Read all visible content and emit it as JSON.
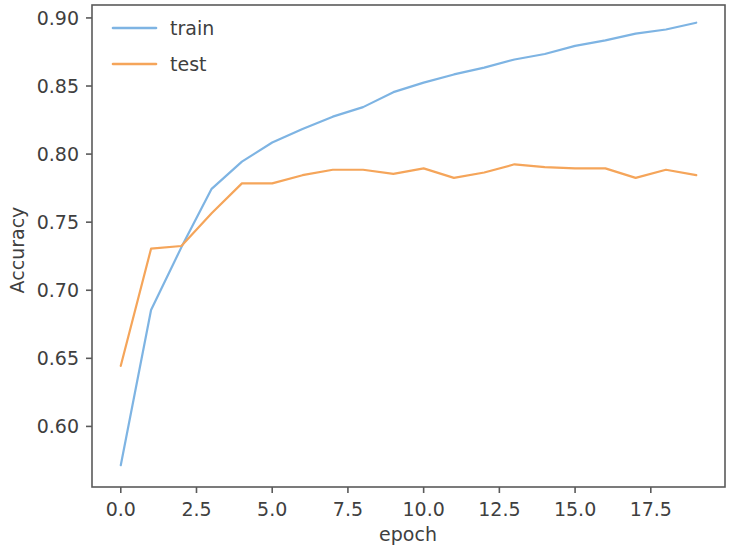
{
  "chart_data": {
    "type": "line",
    "title": "",
    "xlabel": "epoch",
    "ylabel": "Accuracy",
    "xlim": [
      -0.95,
      19.95
    ],
    "ylim": [
      0.5555,
      0.9095
    ],
    "grid": false,
    "legend_position": "upper left",
    "legend_frame": false,
    "xticks": [
      0.0,
      2.5,
      5.0,
      7.5,
      10.0,
      12.5,
      15.0,
      17.5
    ],
    "xtick_labels": [
      "0.0",
      "2.5",
      "5.0",
      "7.5",
      "10.0",
      "12.5",
      "15.0",
      "17.5"
    ],
    "yticks": [
      0.6,
      0.65,
      0.7,
      0.75,
      0.8,
      0.85,
      0.9
    ],
    "ytick_labels": [
      "0.60",
      "0.65",
      "0.70",
      "0.75",
      "0.80",
      "0.85",
      "0.90"
    ],
    "x": [
      0,
      1,
      2,
      3,
      4,
      5,
      6,
      7,
      8,
      9,
      10,
      11,
      12,
      13,
      14,
      15,
      16,
      17,
      18,
      19
    ],
    "series": [
      {
        "name": "train",
        "color": "#7EB4E3",
        "values": [
          0.5715,
          0.6855,
          0.7315,
          0.7745,
          0.7945,
          0.8085,
          0.8185,
          0.8275,
          0.8345,
          0.8455,
          0.8525,
          0.8585,
          0.8635,
          0.8695,
          0.8735,
          0.8795,
          0.8835,
          0.8885,
          0.8915,
          0.8965
        ]
      },
      {
        "name": "test",
        "color": "#F5A55A",
        "values": [
          0.6445,
          0.7305,
          0.7325,
          0.7565,
          0.7785,
          0.7785,
          0.7845,
          0.7885,
          0.7885,
          0.7855,
          0.7895,
          0.7825,
          0.7865,
          0.7925,
          0.7905,
          0.7895,
          0.7895,
          0.7825,
          0.7885,
          0.7845
        ]
      }
    ]
  },
  "legend": {
    "entries": [
      {
        "label": "train",
        "color": "#7EB4E3"
      },
      {
        "label": "test",
        "color": "#F5A55A"
      }
    ]
  },
  "axes": {
    "xlabel": "epoch",
    "ylabel": "Accuracy",
    "xtick_labels": [
      "0.0",
      "2.5",
      "5.0",
      "7.5",
      "10.0",
      "12.5",
      "15.0",
      "17.5"
    ],
    "ytick_labels": [
      "0.60",
      "0.65",
      "0.70",
      "0.75",
      "0.80",
      "0.85",
      "0.90"
    ]
  },
  "colors": {
    "train": "#7EB4E3",
    "test": "#F5A55A",
    "axis": "#5a5a5a",
    "text": "#3f3f3f",
    "background": "#ffffff"
  }
}
